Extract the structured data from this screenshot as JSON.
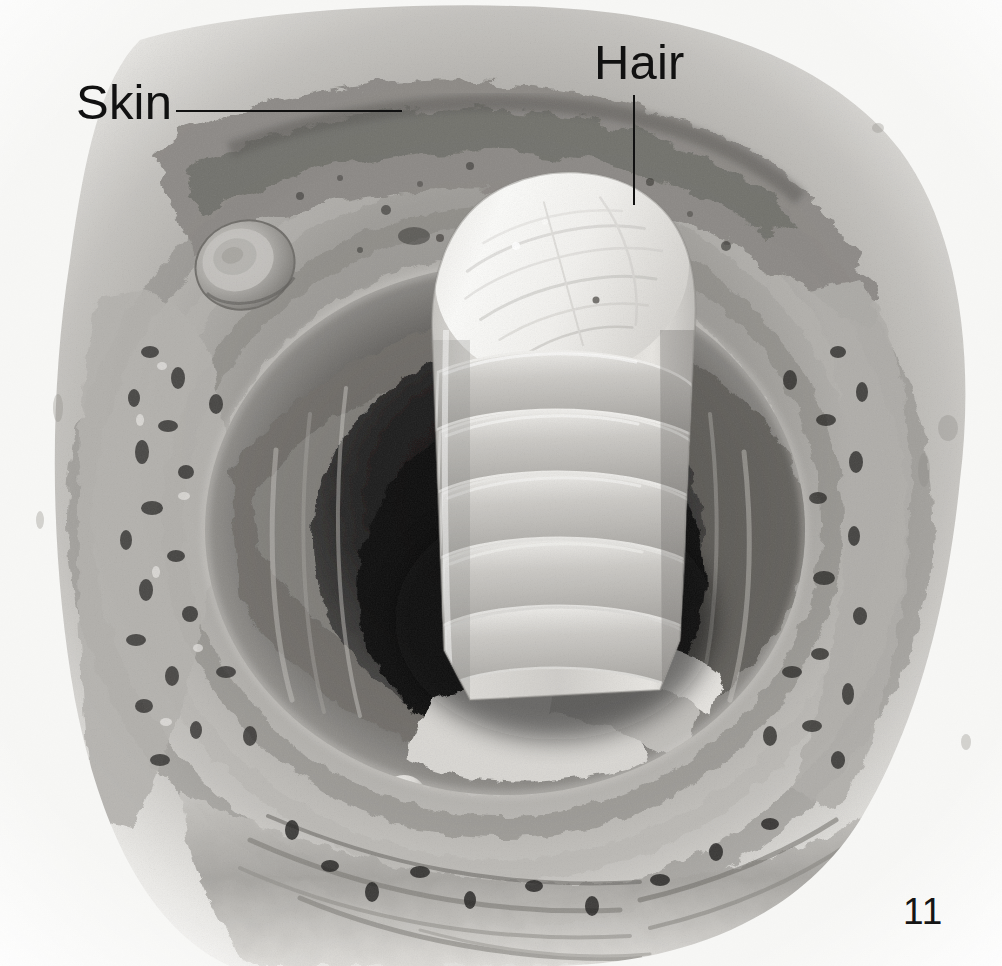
{
  "page": {
    "number": "11",
    "background_color": "#f7f7f5",
    "width": 1002,
    "height": 966
  },
  "figure": {
    "type": "scanning-electron-micrograph",
    "palette": {
      "paper": "#f7f7f5",
      "tissue_light": "#e2e0dc",
      "tissue_mid": "#a9a7a3",
      "tissue_dark": "#6e6c69",
      "cavity_black": "#141414",
      "hair_highlight": "#fafaf8",
      "hair_mid": "#cfcdc9",
      "ink": "#111111"
    }
  },
  "annotations": [
    {
      "id": "skin",
      "label": "Skin",
      "leader": "horizontal",
      "points_to": "epidermal surface at top of specimen"
    },
    {
      "id": "hair",
      "label": "Hair",
      "leader": "vertical",
      "points_to": "cut end of hair shaft"
    }
  ],
  "structures": [
    {
      "name": "hair-shaft",
      "description": "Cut hair shaft with overlapping cuticle scales"
    },
    {
      "name": "hair-follicle-cavity",
      "description": "Dark follicular canal surrounding the hair"
    },
    {
      "name": "epidermis",
      "description": "Granular outer skin surface"
    },
    {
      "name": "dermis",
      "description": "Fibrous, porous connective tissue layers"
    },
    {
      "name": "red-blood-cell",
      "description": "Biconcave disc resting on the skin surface"
    },
    {
      "name": "sebum-droplet",
      "description": "Spherical body in lower follicle region"
    }
  ]
}
